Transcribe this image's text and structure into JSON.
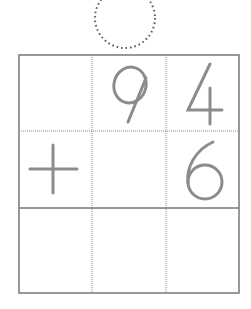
{
  "worksheet": {
    "problem": "9 4 + 6",
    "rows": [
      {
        "cells": [
          "",
          "9",
          "4"
        ]
      },
      {
        "cells": [
          "+",
          "",
          "6"
        ]
      },
      {
        "cells": [
          "",
          "",
          ""
        ]
      }
    ],
    "carry_circle": "empty",
    "digit_color": "#8c8c8c",
    "line_color": "#6e6e6e"
  }
}
